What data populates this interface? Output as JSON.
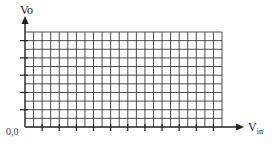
{
  "diagram": {
    "y_axis_label": "Vo",
    "x_axis_label_main": "V",
    "x_axis_label_sub": "in",
    "origin_label": "0,0",
    "grid": {
      "columns": 23,
      "rows": 11,
      "x_ticks_every": 2,
      "y_ticks_every": 2
    },
    "line_color": "#222222"
  }
}
